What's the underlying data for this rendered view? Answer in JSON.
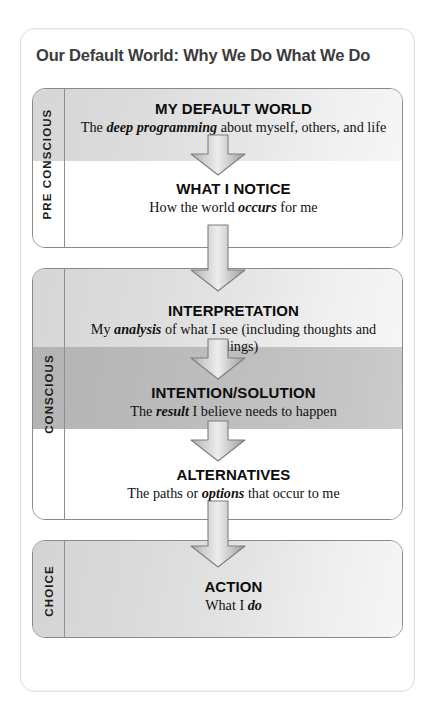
{
  "diagram": {
    "title": "Our Default World: Why We Do What We Do",
    "type": "flowchart",
    "sections": [
      {
        "id": "pre-conscious",
        "label": "PRE CONSCIOUS",
        "nodes": [
          {
            "id": "my-default-world",
            "title": "MY DEFAULT WORLD",
            "desc_before": "The ",
            "desc_emphasis": "deep programming",
            "desc_after": " about myself, others, and life",
            "band": "light-gray"
          },
          {
            "id": "what-i-notice",
            "title": "WHAT I NOTICE",
            "desc_before": "How the world ",
            "desc_emphasis": "occurs",
            "desc_after": " for me",
            "band": "white"
          }
        ]
      },
      {
        "id": "conscious",
        "label": "CONSCIOUS",
        "nodes": [
          {
            "id": "interpretation",
            "title": "INTERPRETATION",
            "desc_before": "My ",
            "desc_emphasis": "analysis",
            "desc_after": " of what I see (including thoughts and feelings)",
            "band": "light-gray"
          },
          {
            "id": "intention-solution",
            "title": "INTENTION/SOLUTION",
            "desc_before": "The ",
            "desc_emphasis": "result",
            "desc_after": " I believe needs to happen",
            "band": "mid-gray"
          },
          {
            "id": "alternatives",
            "title": "ALTERNATIVES",
            "desc_before": "The paths or ",
            "desc_emphasis": "options",
            "desc_after": " that occur to me",
            "band": "white"
          }
        ]
      },
      {
        "id": "choice",
        "label": "CHOICE",
        "nodes": [
          {
            "id": "action",
            "title": "ACTION",
            "desc_before": "What I ",
            "desc_emphasis": "do",
            "desc_after": "",
            "band": "light-gray"
          }
        ]
      }
    ],
    "arrows": [
      {
        "id": "arrow-default-to-notice",
        "from": "my-default-world",
        "to": "what-i-notice",
        "style": "short"
      },
      {
        "id": "arrow-notice-to-interpretation",
        "from": "what-i-notice",
        "to": "interpretation",
        "style": "long"
      },
      {
        "id": "arrow-interpretation-to-intention",
        "from": "interpretation",
        "to": "intention-solution",
        "style": "short"
      },
      {
        "id": "arrow-intention-to-alternatives",
        "from": "intention-solution",
        "to": "alternatives",
        "style": "short"
      },
      {
        "id": "arrow-alternatives-to-action",
        "from": "alternatives",
        "to": "action",
        "style": "long"
      }
    ],
    "colors": {
      "band_light": "#dcdcdc",
      "band_mid": "#bcbcbc",
      "band_white": "#ffffff",
      "box_border": "#8a8a8a",
      "title_text": "#3c3c3c",
      "body_text": "#111111",
      "arrow_fill": "#c9c9c9",
      "arrow_stroke": "#8d8d8d"
    }
  }
}
